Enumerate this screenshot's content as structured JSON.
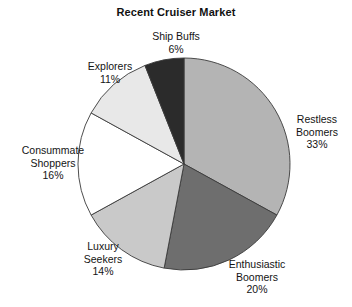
{
  "chart_data": {
    "type": "pie",
    "title": "Recent Cruiser Market",
    "xlabel": "",
    "ylabel": "",
    "legend_position": "none",
    "grid": false,
    "units": "percent",
    "start_angle_deg": 0,
    "direction": "clockwise",
    "categories": [
      "Restless Boomers",
      "Enthusiastic Boomers",
      "Luxury Seekers",
      "Consummate Shoppers",
      "Explorers",
      "Ship Buffs"
    ],
    "values": [
      33,
      20,
      14,
      16,
      11,
      6
    ],
    "slices": [
      {
        "label": "Restless Boomers",
        "label_line1": "Restless",
        "label_line2": "Boomers",
        "value": 33,
        "value_text": "33%",
        "color": "#b4b4b4"
      },
      {
        "label": "Enthusiastic Boomers",
        "label_line1": "Enthusiastic",
        "label_line2": "Boomers",
        "value": 20,
        "value_text": "20%",
        "color": "#6e6e6e"
      },
      {
        "label": "Luxury Seekers",
        "label_line1": "Luxury",
        "label_line2": "Seekers",
        "value": 14,
        "value_text": "14%",
        "color": "#c9c9c9"
      },
      {
        "label": "Consummate Shoppers",
        "label_line1": "Consummate",
        "label_line2": "Shoppers",
        "value": 16,
        "value_text": "16%",
        "color": "#ffffff"
      },
      {
        "label": "Explorers",
        "label_line1": "Explorers",
        "label_line2": "",
        "value": 11,
        "value_text": "11%",
        "color": "#e8e8e8"
      },
      {
        "label": "Ship Buffs",
        "label_line1": "Ship Buffs",
        "label_line2": "",
        "value": 6,
        "value_text": "6%",
        "color": "#2b2b2b"
      }
    ],
    "geometry": {
      "center_x": 184,
      "center_y": 164,
      "radius": 106,
      "stroke_color": "#3a3a3a",
      "stroke_width": 0.9
    }
  }
}
